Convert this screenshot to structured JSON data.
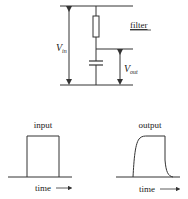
{
  "circuit": {
    "title": "filter",
    "vin_label": {
      "main": "V",
      "sub": "in"
    },
    "vout_label": {
      "main": "V",
      "sub": "out"
    },
    "components": [
      "resistor",
      "capacitor"
    ]
  },
  "waveforms": {
    "input": {
      "label": "input",
      "axis_label": "time",
      "axis_arrow": "→",
      "shape": "square-pulse"
    },
    "output": {
      "label": "output",
      "axis_label": "time",
      "axis_arrow": "→",
      "shape": "rounded-pulse"
    }
  },
  "colors": {
    "stroke": "#333333",
    "background": "#ffffff"
  }
}
